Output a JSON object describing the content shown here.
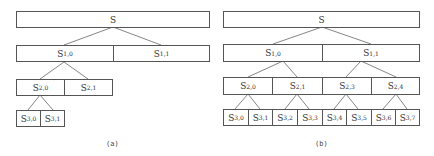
{
  "figure_a": {
    "caption": "(a)",
    "root": {
      "label": "S",
      "sub": ""
    },
    "level1": [
      {
        "label": "S",
        "sub": "1,0"
      },
      {
        "label": "S",
        "sub": "1,1"
      }
    ],
    "level2": [
      {
        "label": "S",
        "sub": "2,0"
      },
      {
        "label": "S",
        "sub": "2,1"
      }
    ],
    "level3": [
      {
        "label": "S",
        "sub": "3,0"
      },
      {
        "label": "S",
        "sub": "3,1"
      }
    ]
  },
  "figure_b": {
    "caption": "(b)",
    "root": {
      "label": "S",
      "sub": ""
    },
    "level1": [
      {
        "label": "S",
        "sub": "1,0"
      },
      {
        "label": "S",
        "sub": "1,1"
      }
    ],
    "level2": [
      {
        "label": "S",
        "sub": "2,0"
      },
      {
        "label": "S",
        "sub": "2,1"
      },
      {
        "label": "S",
        "sub": "2,3"
      },
      {
        "label": "S",
        "sub": "2,4"
      }
    ],
    "level3": [
      {
        "label": "S",
        "sub": "3,0"
      },
      {
        "label": "S",
        "sub": "3,1"
      },
      {
        "label": "S",
        "sub": "3,2"
      },
      {
        "label": "S",
        "sub": "3,3"
      },
      {
        "label": "S",
        "sub": "3,4"
      },
      {
        "label": "S",
        "sub": "3,5"
      },
      {
        "label": "S",
        "sub": "3,6"
      },
      {
        "label": "S",
        "sub": "3,7"
      }
    ]
  },
  "colors": {
    "stroke": "#555555",
    "text": "#333333",
    "background": "#ffffff"
  }
}
